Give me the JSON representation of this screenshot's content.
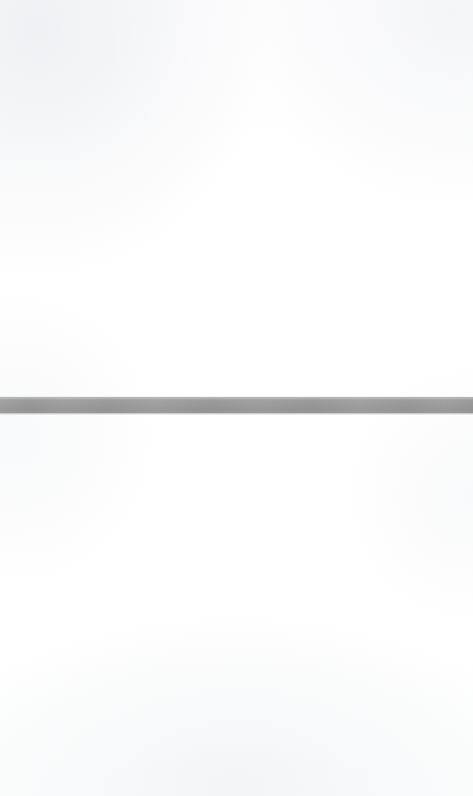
{
  "page": {
    "kind": "scanned-document-page",
    "width": 473,
    "height": 796,
    "background_color": "#ffffff",
    "paper_tone_color": "#fefefe",
    "visible_text": "",
    "notes_label": "Blank scanned page with a single horizontal rule"
  },
  "regions": {
    "upper_blank": {
      "label": "Upper blank area",
      "text": "",
      "top": 0,
      "height": 397
    },
    "lower_blank": {
      "label": "Lower blank area",
      "text": "",
      "top": 414,
      "height": 382
    }
  },
  "rule": {
    "label": "Horizontal rule",
    "color": "#9b9b9b",
    "edge_highlight_color": "#c9c9c9",
    "top": 397,
    "height": 16,
    "left": 0,
    "width": 473,
    "full_bleed": true
  }
}
